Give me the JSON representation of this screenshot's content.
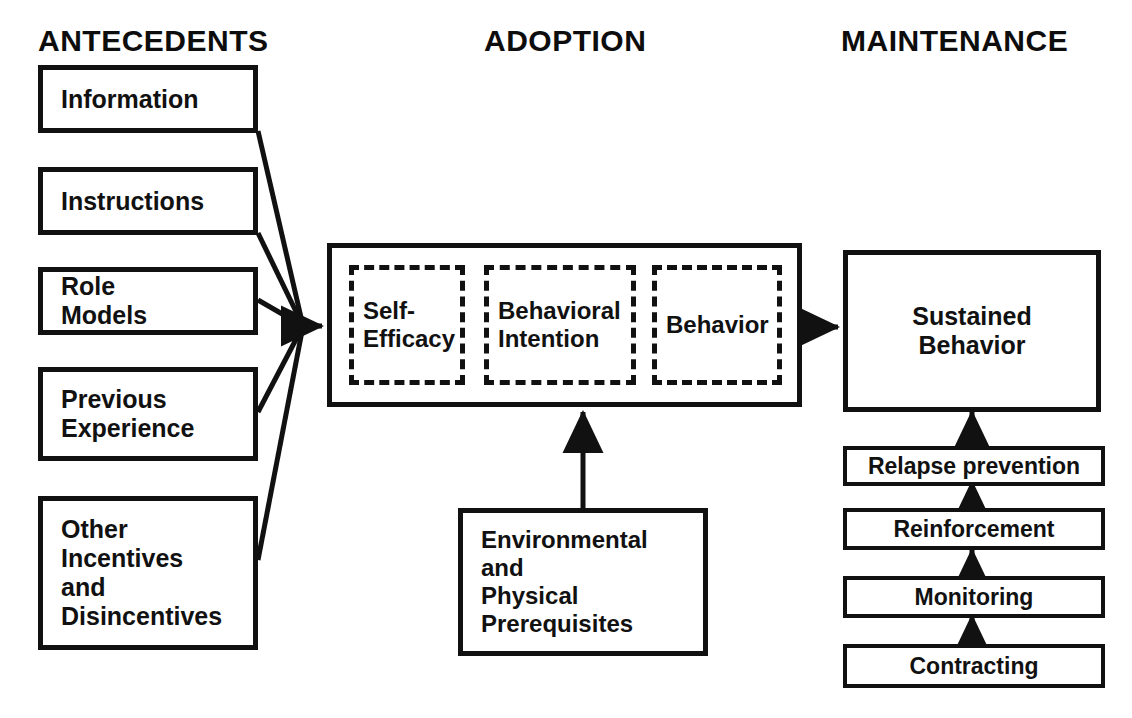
{
  "diagram": {
    "colors": {
      "ink": "#111111",
      "background": "#ffffff"
    },
    "columns": [
      {
        "id": "antecedents",
        "label": "ANTECEDENTS"
      },
      {
        "id": "adoption",
        "label": "ADOPTION"
      },
      {
        "id": "maintenance",
        "label": "MAINTENANCE"
      }
    ],
    "antecedents": {
      "boxes": [
        {
          "id": "information",
          "label": "Information"
        },
        {
          "id": "instructions",
          "label": "Instructions"
        },
        {
          "id": "role-models",
          "label": "Role\nModels"
        },
        {
          "id": "previous-experience",
          "label": "Previous\nExperience"
        },
        {
          "id": "other-incentives",
          "label": "Other\nIncentives\nand\nDisincentives"
        }
      ]
    },
    "adoption": {
      "stages": [
        {
          "id": "self-efficacy",
          "label": "Self-\nEfficacy"
        },
        {
          "id": "behavioral-intention",
          "label": "Behavioral\nIntention"
        },
        {
          "id": "behavior",
          "label": "Behavior"
        }
      ],
      "support": {
        "id": "environmental-physical-prerequisites",
        "label": "Environmental\nand\nPhysical\nPrerequisites"
      }
    },
    "maintenance": {
      "outcome": {
        "id": "sustained-behavior",
        "label": "Sustained\nBehavior"
      },
      "strategies": [
        {
          "id": "relapse-prevention",
          "label": "Relapse prevention"
        },
        {
          "id": "reinforcement",
          "label": "Reinforcement"
        },
        {
          "id": "monitoring",
          "label": "Monitoring"
        },
        {
          "id": "contracting",
          "label": "Contracting"
        }
      ]
    },
    "connectors": [
      {
        "id": "antecedents-to-adoption",
        "from": "antecedents",
        "to": "self-efficacy",
        "style": "converging-arrow"
      },
      {
        "id": "self-efficacy-to-intention",
        "from": "self-efficacy",
        "to": "behavioral-intention",
        "style": "arrow"
      },
      {
        "id": "intention-to-behavior",
        "from": "behavioral-intention",
        "to": "behavior",
        "style": "arrow"
      },
      {
        "id": "adoption-to-sustained",
        "from": "adoption",
        "to": "sustained-behavior",
        "style": "arrow"
      },
      {
        "id": "prerequisites-to-adoption",
        "from": "environmental-physical-prerequisites",
        "to": "adoption",
        "style": "arrow-up"
      },
      {
        "id": "relapse-to-sustained",
        "from": "relapse-prevention",
        "to": "sustained-behavior",
        "style": "arrow-up"
      },
      {
        "id": "reinforcement-to-relapse",
        "from": "reinforcement",
        "to": "relapse-prevention",
        "style": "arrow-up"
      },
      {
        "id": "monitoring-to-reinforcement",
        "from": "monitoring",
        "to": "reinforcement",
        "style": "arrow-up"
      },
      {
        "id": "contracting-to-monitoring",
        "from": "contracting",
        "to": "monitoring",
        "style": "arrow-up"
      }
    ]
  }
}
